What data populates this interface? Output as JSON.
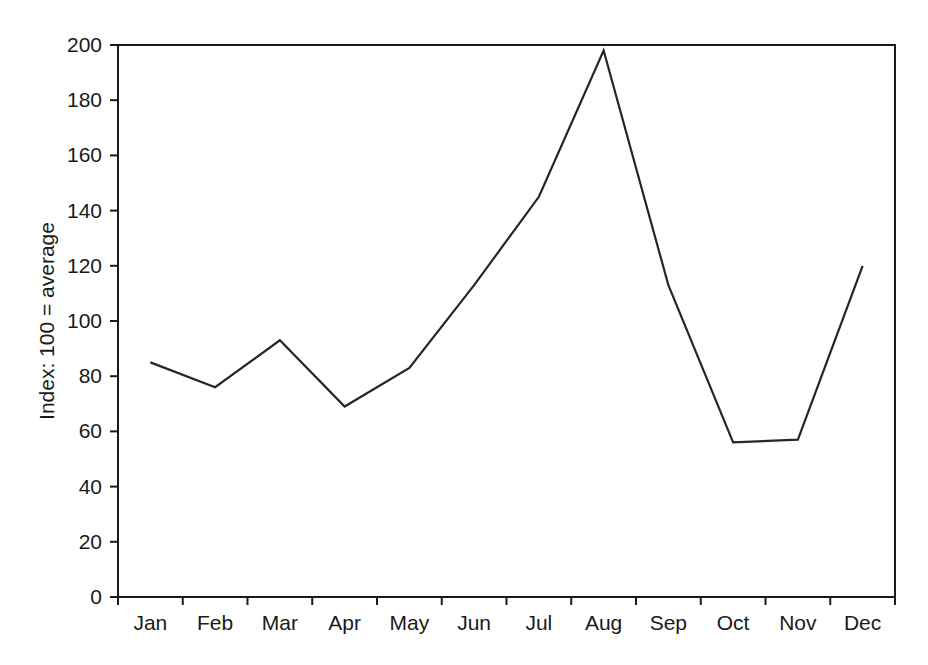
{
  "chart_data": {
    "type": "line",
    "title": "",
    "subtitle": "",
    "xlabel": "",
    "ylabel": "Index: 100 = average",
    "categories": [
      "Jan",
      "Feb",
      "Mar",
      "Apr",
      "May",
      "Jun",
      "Jul",
      "Aug",
      "Sep",
      "Oct",
      "Nov",
      "Dec"
    ],
    "values": [
      85,
      76,
      93,
      69,
      83,
      113,
      145,
      198,
      113,
      56,
      57,
      120
    ],
    "series": [
      {
        "name": "Index",
        "values": [
          85,
          76,
          93,
          69,
          83,
          113,
          145,
          198,
          113,
          56,
          57,
          120
        ]
      }
    ],
    "ylim": [
      0,
      200
    ],
    "ytick_labels": [
      "0",
      "20",
      "40",
      "60",
      "80",
      "100",
      "120",
      "140",
      "160",
      "180",
      "200"
    ],
    "ytick_values": [
      0,
      20,
      40,
      60,
      80,
      100,
      120,
      140,
      160,
      180,
      200
    ],
    "xtick_labels": [
      "Jan",
      "Feb",
      "Mar",
      "Apr",
      "May",
      "Jun",
      "Jul",
      "Aug",
      "Sep",
      "Oct",
      "Nov",
      "Dec"
    ],
    "grid": false,
    "legend": false,
    "legend_position": "none",
    "line_color": "#262626",
    "axis_color": "#1a1a1a",
    "background_color": "#ffffff",
    "annotations": []
  }
}
